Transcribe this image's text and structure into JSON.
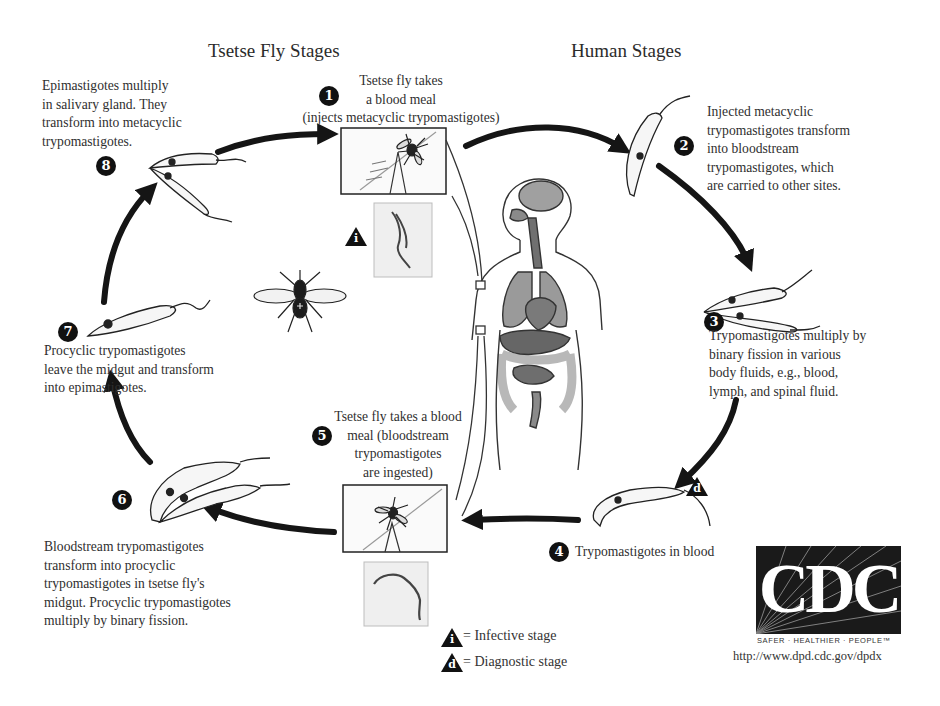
{
  "headings": {
    "tsetse": "Tsetse Fly Stages",
    "human": "Human Stages"
  },
  "stages": [
    {
      "num": "1",
      "lines": [
        "Tsetse fly takes",
        "a blood meal",
        "(injects metacyclic trypomastigotes)"
      ]
    },
    {
      "num": "2",
      "lines": [
        "Injected metacyclic",
        "trypomastigotes transform",
        "into bloodstream",
        "trypomastigotes, which",
        "are carried to other sites."
      ]
    },
    {
      "num": "3",
      "lines": [
        "Trypomastigotes multiply by",
        "binary fission in various",
        "body fluids, e.g., blood,",
        "lymph, and spinal fluid."
      ]
    },
    {
      "num": "4",
      "lines": [
        "Trypomastigotes in blood"
      ]
    },
    {
      "num": "5",
      "lines": [
        "Tsetse fly takes a blood",
        "meal (bloodstream",
        "trypomastigotes",
        "are ingested)"
      ]
    },
    {
      "num": "6",
      "lines": [
        "Bloodstream trypomastigotes",
        "transform into procyclic",
        "trypomastigotes in tsetse fly's",
        "midgut. Procyclic trypomastigotes",
        "multiply by binary fission."
      ]
    },
    {
      "num": "7",
      "lines": [
        "Procyclic trypomastigotes",
        "leave the midgut and transform",
        "into epimastigotes."
      ]
    },
    {
      "num": "8",
      "lines": [
        "Epimastigotes multiply",
        "in salivary gland. They",
        "transform into metacyclic",
        "trypomastigotes."
      ]
    }
  ],
  "markers": {
    "infective": "i",
    "diagnostic": "d"
  },
  "legend": {
    "infective": "= Infective stage",
    "diagnostic": "= Diagnostic stage"
  },
  "logo": {
    "letters": "CDC",
    "tagline": "SAFER · HEALTHIER · PEOPLE™",
    "url": "http://www.dpd.cdc.gov/dpdx"
  },
  "colors": {
    "ink": "#111111",
    "text": "#2f2f2f",
    "organ_dark": "#6e6e6e",
    "organ_mid": "#8c8c8c",
    "organ_light": "#b4b4b4",
    "panel_bg": "#efefef"
  }
}
